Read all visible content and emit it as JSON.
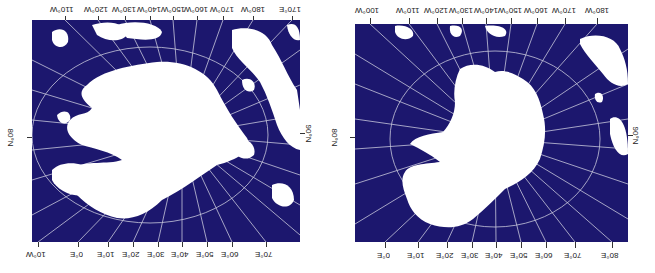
{
  "figure": {
    "orientation": "rotated 180 degrees",
    "colors": {
      "ocean": "#1c176e",
      "ice": "#ffffff",
      "grid": "#c8c8dc"
    }
  },
  "maps": [
    {
      "name": "left-map",
      "top_labels": [
        "110°W",
        "120°W",
        "130°W",
        "140°W",
        "150°W",
        "160°W",
        "170°W",
        "180°W",
        "170°E"
      ],
      "bottom_labels": [
        "10°W",
        "0°E",
        "10°E",
        "20°E",
        "30°E",
        "40°E",
        "50°E",
        "60°E",
        "70°E"
      ],
      "left_label": "80°N",
      "right_label": "90°N"
    },
    {
      "name": "right-map",
      "top_labels": [
        "100°W",
        "110°W",
        "120°W",
        "130°W",
        "140°W",
        "150°W",
        "160°W",
        "170°W",
        "180°W"
      ],
      "bottom_labels": [
        "0°E",
        "10°E",
        "20°E",
        "30°E",
        "40°E",
        "50°E",
        "60°E",
        "70°E",
        "80°E"
      ],
      "left_label": "80°N",
      "right_label": "90°N"
    }
  ]
}
